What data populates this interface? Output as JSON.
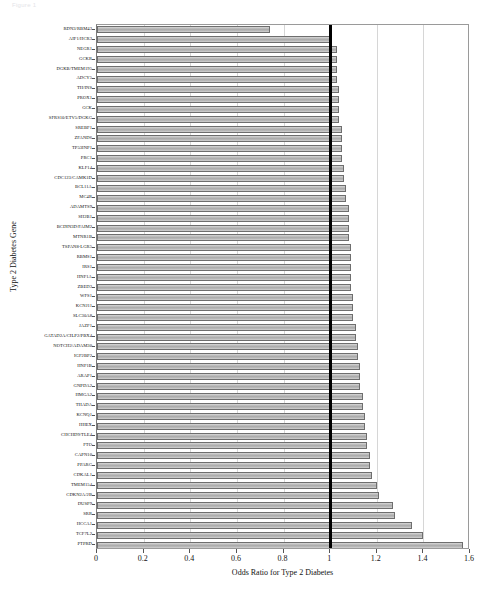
{
  "header_text": "Figure 1",
  "chart_data": {
    "type": "bar",
    "orientation": "horizontal",
    "title": "",
    "xlabel": "Odds Ratio for Type 2 Diabetes",
    "ylabel": "Type 2 Diabetes Gene",
    "xlim": [
      0,
      1.6
    ],
    "xticks": [
      0,
      0.2,
      0.4,
      0.6,
      0.8,
      1,
      1.2,
      1.4,
      1.6
    ],
    "xtick_labels": [
      "0",
      "0.2",
      "0.4",
      "0.6",
      "0.8",
      "1",
      "1.2",
      "1.4",
      "1.6"
    ],
    "grid": "vertical",
    "legend": "none",
    "reference_line": {
      "value": 1.0,
      "color": "#000000",
      "width_px": 3
    },
    "bar_color": "#b8b8b8",
    "bar_edge_color": "#6e6e6e",
    "categories": [
      "RDN3/RBM43",
      "AIF1/HCR3",
      "NEGR1",
      "GCKR",
      "DGKB/TMEM195",
      "ADCY5",
      "TH/INS",
      "PROX1",
      "GCK",
      "SFRS10/ETV5/DGKG",
      "SREBF1",
      "ZFAND6",
      "TP53INP1",
      "PRC1",
      "KLF14",
      "CDC123/CAMK1D",
      "BCL11A",
      "MC4R",
      "ADAMTS9",
      "SH2B1",
      "BCDIN3D/FAIM2",
      "MTNR1B",
      "TSPAN8-LGR5",
      "RBMS1",
      "IRS1",
      "HNF1A",
      "ZBED3",
      "WFS1",
      "KCNJ11",
      "SLC30A8",
      "JAZF1",
      "GATAD2A/CILP2/PBX4",
      "NOTCH2/ADAM30",
      "IGF2BP2",
      "HNF1B",
      "ARAP1",
      "GNPDA2",
      "HMGA2",
      "THADA",
      "KCNQ1",
      "HHEX",
      "CHCHD9/TLE4",
      "FTO",
      "CAPN10",
      "PPARG",
      "CDKAL1",
      "TMEM154",
      "CDKN2A/2B",
      "DUSP9",
      "SRR",
      "HCCA1",
      "TCF7L2",
      "PTPRD"
    ],
    "values": [
      0.74,
      1.01,
      1.03,
      1.03,
      1.03,
      1.03,
      1.04,
      1.04,
      1.04,
      1.04,
      1.05,
      1.05,
      1.05,
      1.05,
      1.06,
      1.06,
      1.07,
      1.07,
      1.08,
      1.08,
      1.08,
      1.08,
      1.09,
      1.09,
      1.09,
      1.09,
      1.09,
      1.1,
      1.1,
      1.1,
      1.11,
      1.11,
      1.12,
      1.12,
      1.13,
      1.13,
      1.13,
      1.14,
      1.14,
      1.15,
      1.15,
      1.16,
      1.16,
      1.17,
      1.17,
      1.18,
      1.2,
      1.21,
      1.27,
      1.28,
      1.35,
      1.4,
      1.57
    ],
    "ylabel_axis": "Type 2 Diabetes Gene"
  }
}
